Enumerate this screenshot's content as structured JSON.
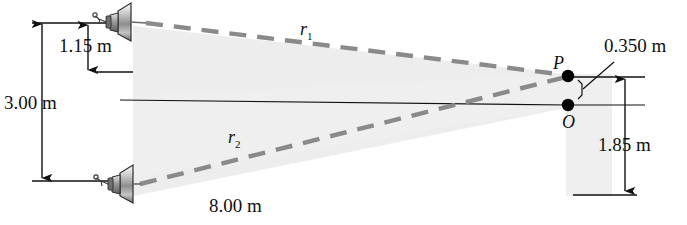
{
  "figure": {
    "colors": {
      "line": "#1a1a1a",
      "dashed_ray": "#8a8a8a",
      "shade": "#ececed",
      "point": "#000000",
      "speaker_body": "#b9b9b9",
      "speaker_edge": "#3a3a3a"
    }
  },
  "labels": {
    "vertical_total": "3.00 m",
    "vertical_upper": "1.15 m",
    "vertical_right": "1.85 m",
    "horizontal_base": "8.00 m",
    "point_separation": "0.350 m",
    "ray_top": "r",
    "ray_top_sub": "1",
    "ray_bottom": "r",
    "ray_bottom_sub": "2",
    "point_p": "P",
    "point_o": "O"
  },
  "geometry": {
    "speaker_top": {
      "x": 120,
      "y": 20
    },
    "speaker_bottom": {
      "x": 120,
      "y": 182
    },
    "point_p": {
      "x": 568,
      "y": 76
    },
    "point_o": {
      "x": 568,
      "y": 105
    },
    "axis_left_x": 120,
    "axis_y": 102
  },
  "icons": {
    "speaker_top": "loudspeaker-icon",
    "speaker_bottom": "loudspeaker-icon"
  }
}
